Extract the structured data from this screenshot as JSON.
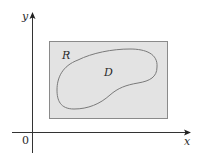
{
  "diagram": {
    "axes": {
      "x_label": "x",
      "y_label": "y",
      "origin_label": "0"
    },
    "rectangle": {
      "label": "R",
      "fill": "#e3e3e3",
      "stroke": "#888888"
    },
    "region": {
      "label": "D",
      "stroke": "#7a7a7a"
    },
    "colors": {
      "axis": "#333333",
      "text": "#2a2a2a",
      "background": "#ffffff"
    }
  }
}
